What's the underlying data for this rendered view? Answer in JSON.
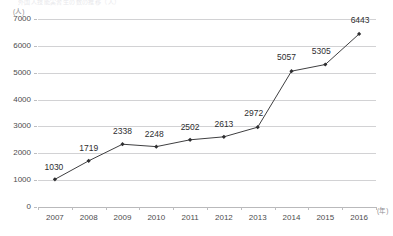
{
  "title_faint": "外国人技能実習生の数の推移（人）",
  "axes": {
    "y_unit": "(人)",
    "x_unit": "(年)",
    "y_ticks": [
      "7000",
      "6000",
      "5000",
      "4000",
      "3000",
      "2000",
      "1000",
      "0"
    ],
    "y_min": 0,
    "y_max": 7000,
    "y_step": 1000
  },
  "colors": {
    "line": "#3f3f41",
    "marker": "#2e2e30",
    "gridline": "#d2d2d4",
    "baseline": "#b9b9bb",
    "tick_text": "#4c4c4e",
    "label_text": "#2e2e30",
    "unit_text": "#8e8e92",
    "background": "#ffffff"
  },
  "chart_data": {
    "type": "line",
    "title": "",
    "xlabel": "(年)",
    "ylabel": "(人)",
    "ylim": [
      0,
      7000
    ],
    "ystep": 1000,
    "grid": true,
    "legend": "none",
    "categories": [
      "2007",
      "2008",
      "2009",
      "2010",
      "2011",
      "2012",
      "2013",
      "2014",
      "2015",
      "2016"
    ],
    "values": [
      1030,
      1719,
      2338,
      2248,
      2502,
      2613,
      2972,
      5057,
      5305,
      6443
    ],
    "data_labels": [
      "1030",
      "1719",
      "2338",
      "2248",
      "2502",
      "2613",
      "2972",
      "5057",
      "5305",
      "6443"
    ],
    "label_offsets": [
      {
        "dx": -1,
        "dy": -7
      },
      {
        "dx": 0,
        "dy": -8
      },
      {
        "dx": 0,
        "dy": -8
      },
      {
        "dx": -2,
        "dy": -8
      },
      {
        "dx": 0,
        "dy": -8
      },
      {
        "dx": 0,
        "dy": -8
      },
      {
        "dx": -4,
        "dy": -9
      },
      {
        "dx": -5,
        "dy": -9
      },
      {
        "dx": -4,
        "dy": -9
      },
      {
        "dx": 1,
        "dy": -9
      }
    ]
  }
}
